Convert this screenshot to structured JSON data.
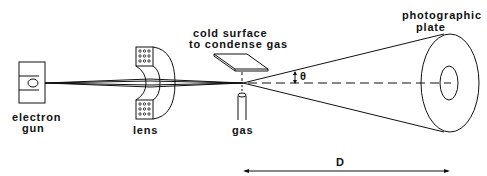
{
  "diagram": {
    "labels": {
      "electron_gun_line1": "electron",
      "electron_gun_line2": "gun",
      "lens": "lens",
      "cold_surface_line1": "cold surface",
      "cold_surface_line2": "to condense gas",
      "gas": "gas",
      "photographic_plate_line1": "photographic",
      "photographic_plate_line2": "plate",
      "theta": "θ",
      "distance": "D"
    },
    "components": [
      "electron gun",
      "lens",
      "cold surface",
      "gas nozzle",
      "scattering cone",
      "photographic plate"
    ],
    "colors": {
      "ink": "#111111",
      "background": "#ffffff"
    }
  }
}
